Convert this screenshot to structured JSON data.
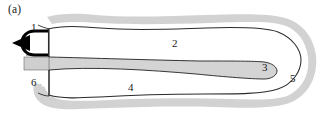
{
  "figure": {
    "panel_label": "(a)",
    "background_color": "#ffffff",
    "outer_halo_color": "#d2d2d2",
    "outline_color": "#2b2b2b",
    "inner_fill_color": "#ffffff",
    "tongue_fill_color": "#d4d4d4",
    "tip_color": "#000000",
    "label_color": "#1a1a1a"
  },
  "callouts": [
    {
      "id": "callout-1",
      "label": "1",
      "x": 31,
      "y": 22,
      "description": "anterior tip region"
    },
    {
      "id": "callout-2",
      "label": "2",
      "x": 172,
      "y": 38,
      "description": "upper body region"
    },
    {
      "id": "callout-3",
      "label": "3",
      "x": 262,
      "y": 62,
      "description": "tapered inner tongue distal end"
    },
    {
      "id": "callout-4",
      "label": "4",
      "x": 128,
      "y": 82,
      "description": "lower body region"
    },
    {
      "id": "callout-5",
      "label": "5",
      "x": 290,
      "y": 73,
      "description": "posterior inner wall"
    },
    {
      "id": "callout-6",
      "label": "6",
      "x": 31,
      "y": 77,
      "description": "ventral proximal region"
    }
  ],
  "shapes": {
    "outer_halo": "irregular rounded capsule outline with soft gray band",
    "inner_body": "white rounded capsule, open at left",
    "tongue": "gray tapered wedge narrowing from left to a rounded tip at right",
    "anterior_tip": "solid black triangle joined to a thick black C-bracket",
    "left_gray_stub": "small gray rectangle projecting left at tongue level"
  }
}
